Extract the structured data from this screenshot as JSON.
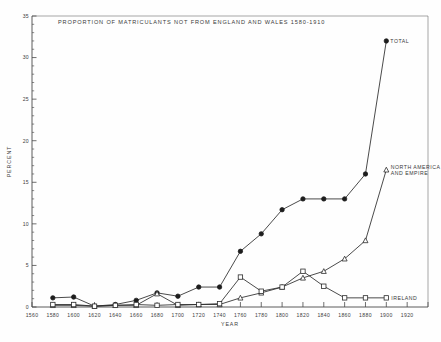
{
  "figure": {
    "title": "PROPORTION OF MATRICULANTS NOT FROM ENGLAND AND WALES 1580-1910",
    "xlabel": "YEAR",
    "ylabel": "PERCENT"
  },
  "axes": {
    "y_ticks": [
      "0",
      "5",
      "10",
      "15",
      "20",
      "25",
      "30",
      "35"
    ],
    "x_ticks": [
      "1560",
      "1580",
      "1600",
      "1620",
      "1640",
      "1660",
      "1680",
      "1700",
      "1720",
      "1740",
      "1760",
      "1780",
      "1800",
      "1820",
      "1840",
      "1860",
      "1880",
      "1900",
      "1920"
    ]
  },
  "labels": {
    "total": "TOTAL",
    "north_america_line1": "NORTH AMERICA",
    "north_america_line2": "AND EMPIRE",
    "ireland": "IRELAND"
  },
  "chart_data": {
    "type": "line",
    "title": "PROPORTION OF MATRICULANTS NOT FROM ENGLAND AND WALES 1580-1910",
    "xlabel": "YEAR",
    "ylabel": "PERCENT",
    "xlim": [
      1560,
      1940
    ],
    "ylim": [
      0,
      35
    ],
    "grid": false,
    "legend": "inline-annotations",
    "series": [
      {
        "name": "TOTAL",
        "marker": "filled-circle",
        "x": [
          1580,
          1600,
          1620,
          1640,
          1660,
          1680,
          1700,
          1720,
          1740,
          1760,
          1780,
          1800,
          1820,
          1840,
          1860,
          1880,
          1900
        ],
        "values": [
          1.1,
          1.2,
          0.1,
          0.3,
          0.8,
          1.7,
          1.3,
          2.4,
          2.4,
          6.7,
          8.8,
          11.7,
          13.0,
          13.0,
          13.0,
          16.0,
          32.0
        ]
      },
      {
        "name": "NORTH AMERICA AND EMPIRE",
        "marker": "open-triangle",
        "x": [
          1580,
          1600,
          1620,
          1640,
          1660,
          1680,
          1700,
          1720,
          1740,
          1760,
          1780,
          1800,
          1820,
          1840,
          1860,
          1880,
          1900
        ],
        "values": [
          0.2,
          0.2,
          0.1,
          0.2,
          0.2,
          1.6,
          0.2,
          0.3,
          0.3,
          1.1,
          1.7,
          2.4,
          3.5,
          4.3,
          5.8,
          8.0,
          16.5
        ]
      },
      {
        "name": "IRELAND",
        "marker": "open-square",
        "x": [
          1580,
          1600,
          1620,
          1640,
          1660,
          1680,
          1700,
          1720,
          1740,
          1760,
          1780,
          1800,
          1820,
          1840,
          1860,
          1880,
          1900
        ],
        "values": [
          0.3,
          0.3,
          0.1,
          0.2,
          0.3,
          0.2,
          0.3,
          0.3,
          0.4,
          3.6,
          1.9,
          2.4,
          4.3,
          2.5,
          1.1,
          1.1,
          1.1
        ]
      }
    ]
  }
}
